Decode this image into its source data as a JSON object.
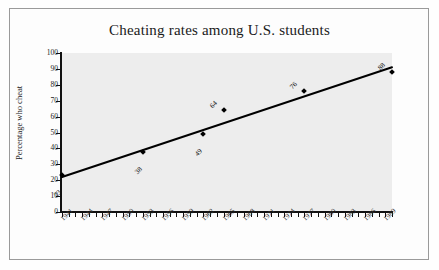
{
  "chart_data": {
    "type": "scatter",
    "title": "Cheating rates among U.S. students",
    "xlabel": "",
    "ylabel": "Percentage who cheat",
    "xlim": [
      1941,
      1990
    ],
    "ylim": [
      0,
      100
    ],
    "grid": false,
    "legend": "none",
    "y_ticks": [
      100,
      90,
      80,
      70,
      60,
      50,
      40,
      30,
      20,
      10,
      0
    ],
    "x_ticks": [
      1941,
      1944,
      1947,
      1950,
      1953,
      1956,
      1959,
      1962,
      1965,
      1968,
      1971,
      1974,
      1977,
      1980,
      1983,
      1986,
      1989
    ],
    "x_tick_interval_minor": 1,
    "points": [
      {
        "x": 1941,
        "y": 23,
        "label": "23"
      },
      {
        "x": 1953,
        "y": 38,
        "label": "38"
      },
      {
        "x": 1962,
        "y": 49,
        "label": "49"
      },
      {
        "x": 1965,
        "y": 64,
        "label": "64"
      },
      {
        "x": 1977,
        "y": 76,
        "label": "76"
      },
      {
        "x": 1990,
        "y": 88,
        "label": "88"
      }
    ],
    "trendline": {
      "type": "linear",
      "x_start": 1941,
      "y_start": 22,
      "x_end": 1990,
      "y_end": 91
    },
    "colors": {
      "marker": "#000000",
      "trendline": "#000000",
      "plot_background": "#ededed",
      "frame_border": "#9a9a9a",
      "axis": "#111111",
      "text": "#1a1a1a"
    }
  }
}
